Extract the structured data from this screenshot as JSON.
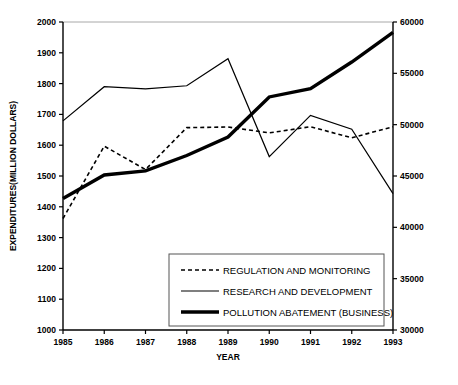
{
  "chart_data": {
    "type": "line",
    "title": "",
    "xlabel": "YEAR",
    "ylabel": "EXPENDITURES(MILLION DOLLARS)",
    "y2label": "",
    "x": [
      1985,
      1986,
      1987,
      1988,
      1989,
      1990,
      1991,
      1992,
      1993
    ],
    "xtick_labels": [
      "1985",
      "1986",
      "1987",
      "1988",
      "1989",
      "1990",
      "1991",
      "1992",
      "1993"
    ],
    "ylim": [
      1000,
      2000
    ],
    "yticks": [
      1000,
      1100,
      1200,
      1300,
      1400,
      1500,
      1600,
      1700,
      1800,
      1900,
      2000
    ],
    "ytick_labels": [
      "1000",
      "1100",
      "1200",
      "1300",
      "1400",
      "1500",
      "1600",
      "1700",
      "1800",
      "1900",
      "2000"
    ],
    "y2lim": [
      30000,
      60000
    ],
    "y2ticks": [
      30000,
      35000,
      40000,
      45000,
      50000,
      55000,
      60000
    ],
    "y2tick_labels": [
      "30000",
      "35000",
      "40000",
      "45000",
      "50000",
      "55000",
      "60000"
    ],
    "grid": false,
    "legend_position": "lower center",
    "series": [
      {
        "name": "REGULATION AND MONITORING",
        "axis": "left",
        "style": "dashed",
        "width": 1.6,
        "color": "#000000",
        "values": [
          1362,
          1597,
          1521,
          1657,
          1659,
          1640,
          1660,
          1624,
          1660
        ]
      },
      {
        "name": "RESEARCH AND DEVELOPMENT",
        "axis": "left",
        "style": "solid",
        "width": 1.2,
        "color": "#000000",
        "values": [
          1679,
          1790,
          1783,
          1793,
          1881,
          1563,
          1697,
          1652,
          1443
        ]
      },
      {
        "name": "POLLUTION ABATEMENT (BUSINESS)",
        "axis": "right",
        "style": "solid-thick",
        "width": 3.4,
        "color": "#000000",
        "values": [
          42800,
          45100,
          45500,
          47000,
          48800,
          52700,
          53500,
          56100,
          59000
        ]
      }
    ]
  },
  "legend": {
    "items": [
      {
        "label": "REGULATION AND MONITORING",
        "style": "dashed"
      },
      {
        "label": "RESEARCH AND DEVELOPMENT",
        "style": "solid"
      },
      {
        "label": "POLLUTION ABATEMENT (BUSINESS)",
        "style": "solid-thick"
      }
    ]
  }
}
